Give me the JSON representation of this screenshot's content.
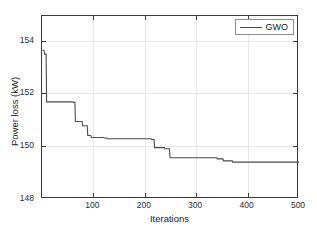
{
  "figure": {
    "background": "#ffffff",
    "axis_color": "#3a3a3a",
    "grid_color": "#e6e6e6"
  },
  "axes": {
    "xlabel": "Iterations",
    "ylabel": "Power loss (kW)",
    "x_ticks": [
      100,
      200,
      300,
      400,
      500
    ],
    "x_tick_labels": [
      "100",
      "200",
      "300",
      "400",
      "500"
    ],
    "y_ticks": [
      148,
      150,
      152,
      154
    ],
    "y_tick_labels": [
      "148",
      "150",
      "152",
      "154"
    ],
    "xlim": [
      0,
      500
    ],
    "ylim": [
      148,
      155.2
    ],
    "grid": true
  },
  "legend": {
    "position": "top-right",
    "entries": [
      {
        "label": "GWO",
        "color": "#4a4a4a"
      }
    ]
  },
  "chart_data": {
    "type": "line",
    "title": "",
    "subtitle": "",
    "xlabel": "Iterations",
    "ylabel": "Power loss (kW)",
    "xlim": [
      0,
      500
    ],
    "ylim": [
      148,
      155.2
    ],
    "grid": true,
    "legend_position": "top-right",
    "x_ticks": [
      100,
      200,
      300,
      400,
      500
    ],
    "y_ticks": [
      148,
      150,
      152,
      154
    ],
    "series": [
      {
        "name": "GWO",
        "color": "#4a4a4a",
        "line_width": 1.1,
        "style": "step-decreasing convergence curve",
        "x": [
          1,
          4,
          5,
          8,
          9,
          60,
          61,
          64,
          65,
          78,
          79,
          88,
          89,
          95,
          96,
          120,
          121,
          126,
          127,
          212,
          213,
          218,
          219,
          238,
          239,
          248,
          249,
          340,
          341,
          352,
          353,
          370,
          371,
          500
        ],
        "y": [
          153.85,
          153.85,
          153.7,
          153.7,
          151.82,
          151.82,
          151.8,
          151.8,
          151.05,
          151.05,
          150.88,
          150.88,
          150.5,
          150.5,
          150.42,
          150.42,
          150.4,
          150.4,
          150.37,
          150.37,
          150.34,
          150.34,
          150.02,
          150.02,
          149.98,
          149.98,
          149.62,
          149.62,
          149.58,
          149.58,
          149.5,
          149.5,
          149.45,
          149.45
        ]
      }
    ],
    "annotations": []
  }
}
